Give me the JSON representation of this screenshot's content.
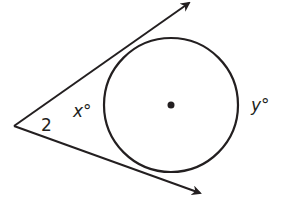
{
  "diagram": {
    "labels": {
      "angle_label": "2",
      "near_arc": "x°",
      "far_arc": "y°"
    },
    "colors": {
      "stroke": "#231f20",
      "background": "#ffffff"
    }
  }
}
